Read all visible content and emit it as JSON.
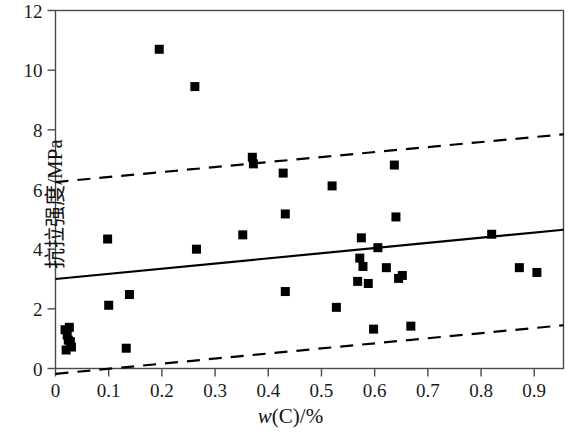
{
  "chart_data": {
    "type": "scatter",
    "title": "",
    "subtitle": "",
    "xlabel": "w(C)/%",
    "ylabel": "抗拉强度/MPa",
    "xlim": [
      0,
      0.955
    ],
    "ylim": [
      0,
      12
    ],
    "grid": false,
    "legend": "none",
    "xticks": [
      0,
      0.1,
      0.2,
      0.3,
      0.4,
      0.5,
      0.6,
      0.7,
      0.8,
      0.9
    ],
    "xtick_labels": [
      "0",
      "0.1",
      "0.2",
      "0.3",
      "0.4",
      "0.5",
      "0.6",
      "0.7",
      "0.8",
      "0.9"
    ],
    "yticks": [
      0,
      2,
      4,
      6,
      8,
      10,
      12
    ],
    "ytick_labels": [
      "0",
      "2",
      "4",
      "6",
      "8",
      "10",
      "12"
    ],
    "marker": "filled-square",
    "marker_color": "#000000",
    "marker_size": 9,
    "points": [
      {
        "x": 0.018,
        "y": 1.3
      },
      {
        "x": 0.022,
        "y": 1.12
      },
      {
        "x": 0.026,
        "y": 1.38
      },
      {
        "x": 0.024,
        "y": 0.95
      },
      {
        "x": 0.028,
        "y": 0.9
      },
      {
        "x": 0.02,
        "y": 0.62
      },
      {
        "x": 0.03,
        "y": 0.72
      },
      {
        "x": 0.098,
        "y": 4.34
      },
      {
        "x": 0.1,
        "y": 2.12
      },
      {
        "x": 0.139,
        "y": 2.48
      },
      {
        "x": 0.133,
        "y": 0.68
      },
      {
        "x": 0.195,
        "y": 10.7
      },
      {
        "x": 0.262,
        "y": 9.45
      },
      {
        "x": 0.265,
        "y": 4.0
      },
      {
        "x": 0.352,
        "y": 4.48
      },
      {
        "x": 0.37,
        "y": 7.08
      },
      {
        "x": 0.372,
        "y": 6.86
      },
      {
        "x": 0.428,
        "y": 6.55
      },
      {
        "x": 0.432,
        "y": 5.18
      },
      {
        "x": 0.432,
        "y": 2.58
      },
      {
        "x": 0.52,
        "y": 6.12
      },
      {
        "x": 0.528,
        "y": 2.05
      },
      {
        "x": 0.575,
        "y": 4.38
      },
      {
        "x": 0.572,
        "y": 3.7
      },
      {
        "x": 0.578,
        "y": 3.42
      },
      {
        "x": 0.568,
        "y": 2.92
      },
      {
        "x": 0.588,
        "y": 2.85
      },
      {
        "x": 0.606,
        "y": 4.05
      },
      {
        "x": 0.622,
        "y": 3.38
      },
      {
        "x": 0.637,
        "y": 6.82
      },
      {
        "x": 0.64,
        "y": 5.08
      },
      {
        "x": 0.645,
        "y": 3.02
      },
      {
        "x": 0.652,
        "y": 3.12
      },
      {
        "x": 0.598,
        "y": 1.32
      },
      {
        "x": 0.668,
        "y": 1.42
      },
      {
        "x": 0.82,
        "y": 4.5
      },
      {
        "x": 0.872,
        "y": 3.38
      },
      {
        "x": 0.905,
        "y": 3.22
      }
    ],
    "lines": [
      {
        "name": "regression-line",
        "style": "solid",
        "color": "#000000",
        "width": 2.2,
        "x_start": 0.0,
        "y_start": 3.0,
        "x_end": 0.955,
        "y_end": 4.65
      },
      {
        "name": "upper-confidence-band",
        "style": "dashed",
        "color": "#000000",
        "width": 2.2,
        "x_start": 0.0,
        "y_start": 6.25,
        "x_end": 0.955,
        "y_end": 7.85
      },
      {
        "name": "lower-confidence-band",
        "style": "dashed",
        "color": "#000000",
        "width": 2.2,
        "x_start": 0.0,
        "y_start": -0.18,
        "x_end": 0.955,
        "y_end": 1.45
      }
    ]
  },
  "axes": {
    "frame_color": "#4a4a4a",
    "tick_color": "#4a4a4a"
  }
}
